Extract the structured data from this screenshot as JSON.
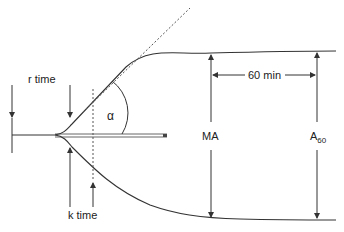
{
  "diagram": {
    "type": "thromboelastography-tracing",
    "colors": {
      "line": "#333333",
      "dashed": "#555555",
      "baseline": "#888888",
      "background": "#ffffff"
    },
    "labels": {
      "r_time": "r time",
      "k_time": "k time",
      "alpha": "α",
      "ma": "MA",
      "a60_main": "A",
      "a60_sub": "60",
      "interval": "60 min"
    }
  }
}
